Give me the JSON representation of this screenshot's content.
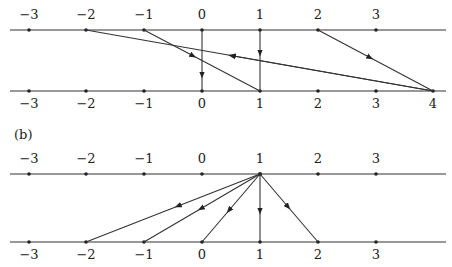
{
  "figure": {
    "panel_b_label": "(b)",
    "tick_positions_px": {
      "-3": 29,
      "-2": 86,
      "-1": 144,
      "0": 202,
      "1": 260,
      "2": 318,
      "3": 376,
      "4": 433
    },
    "panel_a": {
      "top_line": {
        "y": 30,
        "ticks": [
          "-3",
          "-2",
          "-1",
          "0",
          "1",
          "2",
          "3"
        ]
      },
      "bottom_line": {
        "y": 91,
        "ticks": [
          "-3",
          "-2",
          "-1",
          "0",
          "1",
          "2",
          "3",
          "4"
        ]
      },
      "edges": [
        {
          "from": "-2",
          "to": "4",
          "arrow_direction": "toward top (from 4 to -2)",
          "arrow_at": 0.4
        },
        {
          "from": "-1",
          "to": "1",
          "arrow_direction": "down",
          "arrow_at": 0.6
        },
        {
          "from": "0",
          "to": "0",
          "arrow_direction": "down",
          "arrow_at": 0.7
        },
        {
          "from": "1",
          "to": "1",
          "arrow_direction": "down",
          "arrow_at": 0.35
        },
        {
          "from": "2",
          "to": "4",
          "arrow_direction": "down",
          "arrow_at": 0.5
        }
      ]
    },
    "panel_b": {
      "top_line": {
        "y": 174,
        "ticks": [
          "-3",
          "-2",
          "-1",
          "0",
          "1",
          "2",
          "3"
        ]
      },
      "bottom_line": {
        "y": 242,
        "ticks": [
          "-3",
          "-2",
          "-1",
          "0",
          "1",
          "2",
          "3"
        ]
      },
      "edges": [
        {
          "from": "1",
          "to": "-2",
          "arrow_direction": "down",
          "arrow_at": 0.45
        },
        {
          "from": "1",
          "to": "-1",
          "arrow_direction": "down",
          "arrow_at": 0.45
        },
        {
          "from": "1",
          "to": "0",
          "arrow_direction": "down",
          "arrow_at": 0.45
        },
        {
          "from": "1",
          "to": "1",
          "arrow_direction": "down",
          "arrow_at": 0.5
        },
        {
          "from": "1",
          "to": "2",
          "arrow_direction": "down",
          "arrow_at": 0.45
        }
      ]
    }
  },
  "labels": {
    "a_top": [
      "−3",
      "−2",
      "−1",
      "0",
      "1",
      "2",
      "3"
    ],
    "a_bottom": [
      "−3",
      "−2",
      "−1",
      "0",
      "1",
      "2",
      "3",
      "4"
    ],
    "b_top": [
      "−3",
      "−2",
      "−1",
      "0",
      "1",
      "2",
      "3"
    ],
    "b_bottom": [
      "−3",
      "−2",
      "−1",
      "0",
      "1",
      "2",
      "3"
    ]
  }
}
